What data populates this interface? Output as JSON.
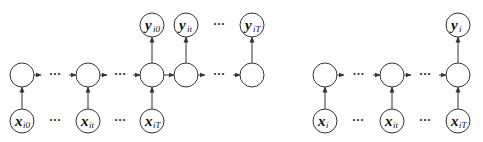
{
  "diagram": {
    "left": {
      "name": "many-to-many",
      "hidden_nodes": [
        {
          "id": "h0",
          "cx": 22,
          "cy": 75
        },
        {
          "id": "ht",
          "cx": 88,
          "cy": 75
        },
        {
          "id": "hT",
          "cx": 152,
          "cy": 75
        },
        {
          "id": "hT1",
          "cx": 186,
          "cy": 75
        },
        {
          "id": "hN",
          "cx": 252,
          "cy": 75
        }
      ],
      "input_nodes": [
        {
          "id": "x0",
          "cx": 22,
          "cy": 121,
          "base": "x",
          "sub": "i0",
          "to": "h0"
        },
        {
          "id": "xt",
          "cx": 88,
          "cy": 121,
          "base": "x",
          "sub": "it",
          "to": "ht"
        },
        {
          "id": "xT",
          "cx": 152,
          "cy": 121,
          "base": "x",
          "sub": "iT",
          "to": "hT"
        }
      ],
      "output_nodes": [
        {
          "id": "y0",
          "cx": 152,
          "cy": 25,
          "base": "y",
          "sub": "i0",
          "from": "hT"
        },
        {
          "id": "yt",
          "cx": 186,
          "cy": 25,
          "base": "y",
          "sub": "it",
          "from": "hT1"
        },
        {
          "id": "yT",
          "cx": 252,
          "cy": 25,
          "base": "y",
          "sub": "iT",
          "from": "hN"
        }
      ],
      "chain_edges": [
        {
          "from": "h0",
          "to": "ht",
          "ellipsis": true
        },
        {
          "from": "ht",
          "to": "hT",
          "ellipsis": true
        },
        {
          "from": "hT",
          "to": "hT1",
          "ellipsis": false
        },
        {
          "from": "hT1",
          "to": "hN",
          "ellipsis": true
        }
      ],
      "ellipses": [
        {
          "x": 55,
          "y": 124,
          "text": "···"
        },
        {
          "x": 120,
          "y": 124,
          "text": "···"
        },
        {
          "x": 219,
          "y": 28,
          "text": "···"
        }
      ]
    },
    "right": {
      "name": "many-to-one",
      "hidden_nodes": [
        {
          "id": "r0",
          "cx": 325,
          "cy": 75
        },
        {
          "id": "rt",
          "cx": 392,
          "cy": 75
        },
        {
          "id": "rT",
          "cx": 458,
          "cy": 75
        }
      ],
      "input_nodes": [
        {
          "id": "rx0",
          "cx": 325,
          "cy": 121,
          "base": "x",
          "sub": "i",
          "to": "r0"
        },
        {
          "id": "rxt",
          "cx": 392,
          "cy": 121,
          "base": "x",
          "sub": "it",
          "to": "rt"
        },
        {
          "id": "rxT",
          "cx": 458,
          "cy": 121,
          "base": "x",
          "sub": "iT",
          "to": "rT"
        }
      ],
      "output_nodes": [
        {
          "id": "ry",
          "cx": 458,
          "cy": 25,
          "base": "y",
          "sub": "i",
          "from": "rT"
        }
      ],
      "chain_edges": [
        {
          "from": "r0",
          "to": "rt",
          "ellipsis": true
        },
        {
          "from": "rt",
          "to": "rT",
          "ellipsis": true
        }
      ],
      "ellipses": [
        {
          "x": 358,
          "y": 124,
          "text": "···"
        },
        {
          "x": 425,
          "y": 124,
          "text": "···"
        }
      ]
    },
    "node_radius": 12
  }
}
